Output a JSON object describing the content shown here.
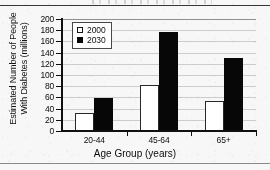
{
  "chart_data": {
    "type": "bar",
    "title": "",
    "xlabel": "Age Group (years)",
    "ylabel": "Estimated Number of People With Diabetes (millions)",
    "ylabel_line1": "Estimated Number of People",
    "ylabel_line2": "With Diabetes (millions)",
    "categories": [
      "20-44",
      "45-64",
      "65+"
    ],
    "series": [
      {
        "name": "2000",
        "values": [
          33,
          83,
          53
        ],
        "color": "#ffffff",
        "marker": "open-square"
      },
      {
        "name": "2030",
        "values": [
          59,
          176,
          130
        ],
        "color": "#0c0c0c",
        "marker": "filled-square"
      }
    ],
    "ylim": [
      0,
      200
    ],
    "yticks": [
      0,
      20,
      40,
      60,
      80,
      100,
      120,
      140,
      160,
      180,
      200
    ],
    "ytick_labels": [
      "0",
      "20",
      "40",
      "60",
      "80",
      "100",
      "120",
      "140",
      "160",
      "180",
      "200"
    ],
    "grid": true,
    "grid_axis": "y",
    "legend_position": "upper-left-inside",
    "legend_entries": [
      "2000",
      "2030"
    ]
  },
  "axes": {
    "y_title_line1": "Estimated Number of People",
    "y_title_line2": "With Diabetes (millions)",
    "x_title": "Age Group (years)"
  },
  "legend": {
    "entries": [
      {
        "label": "2000"
      },
      {
        "label": "2030"
      }
    ]
  }
}
